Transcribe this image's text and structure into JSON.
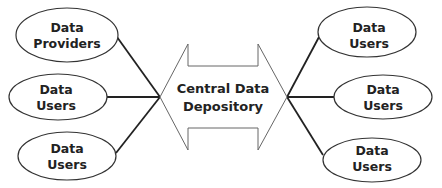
{
  "center": {
    "line1": "Central Data",
    "line2": "Depository"
  },
  "left_nodes": [
    {
      "line1": "Data",
      "line2": "Providers"
    },
    {
      "line1": "Data",
      "line2": "Users"
    },
    {
      "line1": "Data",
      "line2": "Users"
    }
  ],
  "right_nodes": [
    {
      "line1": "Data",
      "line2": "Users"
    },
    {
      "line1": "Data",
      "line2": "Users"
    },
    {
      "line1": "Data",
      "line2": "Users"
    }
  ],
  "colors": {
    "stroke": "#222222",
    "arrow_stroke": "#555555",
    "background": "#ffffff"
  }
}
